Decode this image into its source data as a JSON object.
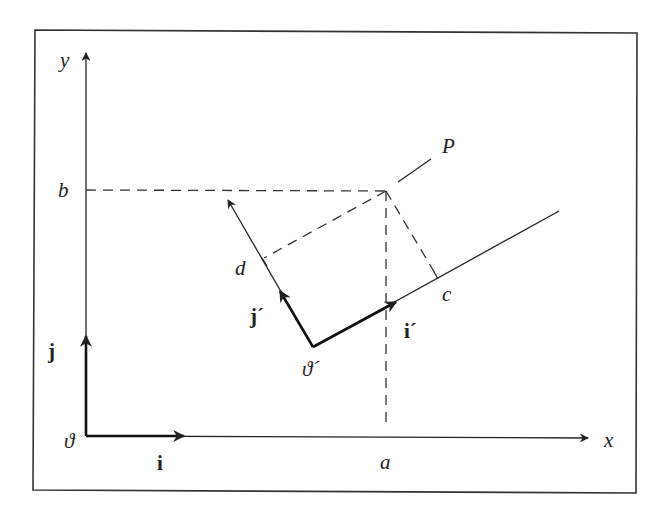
{
  "diagram": {
    "type": "coordinate-frame-rotation",
    "frame_border": true,
    "labels": {
      "x_axis": "x",
      "y_axis": "y",
      "origin": "ϑ",
      "origin_prime": "ϑ´",
      "unit_i": "i",
      "unit_j": "j",
      "unit_i_prime": "i´",
      "unit_j_prime": "j´",
      "point": "P",
      "x_coord": "a",
      "y_coord": "b",
      "x_prime_coord": "c",
      "y_prime_coord": "d"
    },
    "colors": {
      "line": "#222222",
      "background": "#ffffff"
    }
  }
}
